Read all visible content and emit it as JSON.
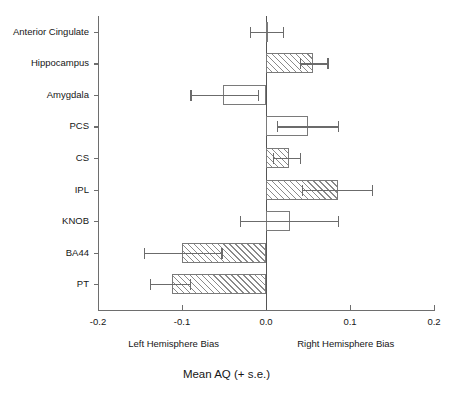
{
  "chart_data": {
    "type": "bar",
    "orientation": "horizontal",
    "title": "",
    "xlabel": "Mean AQ (+ s.e.)",
    "ylabel": "",
    "xlim": [
      -0.2,
      0.2
    ],
    "xticks": [
      "-0.2",
      "-0.1",
      "0.0",
      "0.1",
      "0.2"
    ],
    "xtick_values": [
      -0.2,
      -0.1,
      0.0,
      0.1,
      0.2
    ],
    "grid": false,
    "legend": null,
    "zero_reference_line": 0.0,
    "categories": [
      "Anterior Cingulate",
      "Hippocampus",
      "Amygdala",
      "PCS",
      "CS",
      "IPL",
      "KNOB",
      "BA44",
      "PT"
    ],
    "values": [
      0.001,
      0.056,
      -0.051,
      0.05,
      0.027,
      0.086,
      0.029,
      -0.1,
      -0.112
    ],
    "errors_low": [
      -0.019,
      0.04,
      -0.09,
      0.013,
      0.008,
      0.043,
      -0.031,
      -0.145,
      -0.138
    ],
    "errors_high": [
      0.02,
      0.073,
      -0.01,
      0.086,
      0.04,
      0.126,
      0.086,
      -0.053,
      -0.091
    ],
    "fills": [
      "none",
      "hatched",
      "none",
      "none",
      "hatched",
      "hatched",
      "none",
      "hatched",
      "hatched"
    ],
    "annotations": {
      "left_note": "Left Hemisphere Bias",
      "right_note": "Right Hemisphere Bias"
    }
  },
  "colors": {
    "axis": "#6e6e6e",
    "bar_edge": "#7a7a7a",
    "hatch": "#8a8a8a",
    "error": "#6b6b6b",
    "text": "#161616",
    "background": "#ffffff"
  }
}
